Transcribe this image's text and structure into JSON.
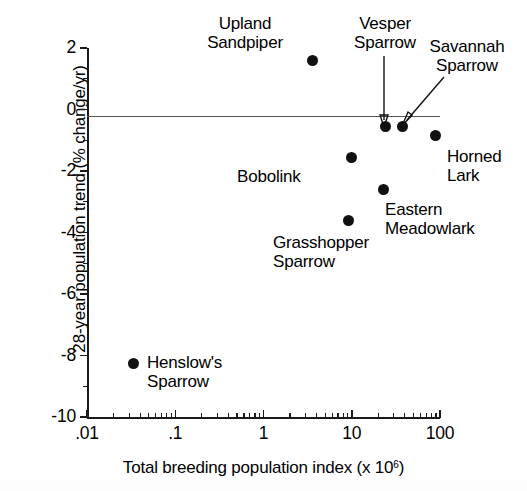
{
  "chart_data": {
    "type": "scatter",
    "title": "",
    "xlabel": "Total breeding population index (x 10⁶)",
    "xlabel_base": "Total breeding population index (x 10",
    "xlabel_exponent": "6",
    "xlabel_tail": ")",
    "ylabel": "28-year population trend (% change/yr)",
    "xscale": "log",
    "yscale": "linear",
    "xlim": [
      0.01,
      100
    ],
    "ylim": [
      -10,
      2
    ],
    "grid": false,
    "legend": "none",
    "zero_reference_line": 0,
    "xticks": [
      ".01",
      ".1",
      "1",
      "10",
      "100"
    ],
    "xtick_values": [
      0.01,
      0.1,
      1,
      10,
      100
    ],
    "yticks": [
      "2",
      "0",
      "-2",
      "-4",
      "-6",
      "-8",
      "-10"
    ],
    "ytick_values": [
      2,
      0,
      -2,
      -4,
      -6,
      -8,
      -10
    ],
    "ytick_minor_values": [
      1,
      -1,
      -3,
      -5,
      -7,
      -9
    ],
    "marker": "filled-circle",
    "marker_color": "#111111",
    "points": [
      {
        "label": "Upland\nSandpiper",
        "x": 3.6,
        "y": 1.6
      },
      {
        "label": "Vesper\nSparrow",
        "x": 24,
        "y": -0.55
      },
      {
        "label": "Savannah\nSparrow",
        "x": 38,
        "y": -0.55
      },
      {
        "label": "Horned\nLark",
        "x": 90,
        "y": -0.85
      },
      {
        "label": "Bobolink",
        "x": 10,
        "y": -1.55
      },
      {
        "label": "Eastern\nMeadowlark",
        "x": 23,
        "y": -2.6
      },
      {
        "label": "Grasshopper\nSparrow",
        "x": 9.2,
        "y": -3.6
      },
      {
        "label": "Henslow's\nSparrow",
        "x": 0.034,
        "y": -8.25
      }
    ],
    "annotations": [
      {
        "label": "Vesper Sparrow",
        "type": "straight-arrow",
        "points_to": "Vesper Sparrow"
      },
      {
        "label": "Savannah Sparrow",
        "type": "diagonal-arrow",
        "points_to": "Savannah Sparrow"
      }
    ]
  },
  "axes": {
    "y_title": "28-year population trend (% change/yr)",
    "x_title_base": "Total breeding population index (x 10",
    "x_title_sup": "6",
    "x_title_tail": ")",
    "ytick_labels": [
      "2",
      "0",
      "-2",
      "-4",
      "-6",
      "-8",
      "-10"
    ],
    "xtick_labels": [
      ".01",
      ".1",
      "1",
      "10",
      "100"
    ]
  },
  "labels": {
    "upland_sandpiper": "Upland\nSandpiper",
    "vesper_sparrow": "Vesper\nSparrow",
    "savannah_sparrow": "Savannah\nSparrow",
    "horned_lark": "Horned\nLark",
    "bobolink": "Bobolink",
    "eastern_meadowlark": "Eastern\nMeadowlark",
    "grasshopper_sparrow": "Grasshopper\nSparrow",
    "henslows_sparrow": "Henslow's\nSparrow"
  }
}
